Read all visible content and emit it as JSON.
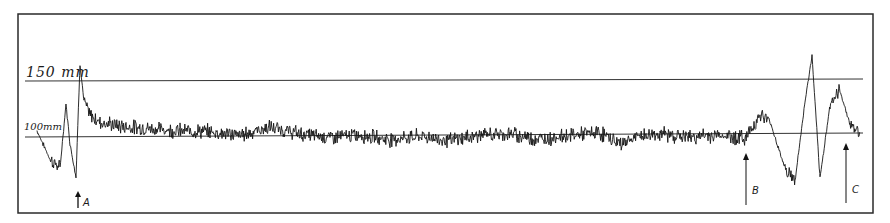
{
  "chart_data": {
    "type": "line",
    "title": "",
    "xlabel": "",
    "ylabel": "Pressure (mm)",
    "ylim": [
      60,
      175
    ],
    "grid": false,
    "reference_lines": [
      {
        "label": "150 mm",
        "value": 150
      },
      {
        "label": "100 mm",
        "value": 100
      }
    ],
    "annotations": [
      {
        "label": "A",
        "x_px": 78,
        "description": "arrow marking event A near start of trace"
      },
      {
        "label": "B",
        "x_px": 746,
        "description": "arrow marking event B, onset of rise"
      },
      {
        "label": "C",
        "x_px": 846,
        "description": "arrow marking event C near end of trace"
      }
    ],
    "series": [
      {
        "name": "pressure trace",
        "description": "Noisy continuous recording oscillating around ~100 mm for most of its length, with large excursions near A (rising above 150 mm) and between B and C (peaks above 150 mm and drops to ~55 mm).",
        "x_px": [
          37,
          50,
          60,
          66,
          70,
          76,
          80,
          84,
          90,
          100,
          120,
          150,
          180,
          210,
          240,
          270,
          300,
          330,
          360,
          390,
          420,
          450,
          480,
          510,
          540,
          570,
          600,
          620,
          640,
          660,
          690,
          720,
          745,
          760,
          770,
          785,
          795,
          805,
          812,
          820,
          830,
          840,
          850,
          860
        ],
        "values": [
          104,
          78,
          70,
          128,
          92,
          62,
          165,
          130,
          118,
          112,
          108,
          106,
          104,
          103,
          100,
          107,
          101,
          98,
          100,
          96,
          99,
          95,
          100,
          101,
          96,
          100,
          102,
          92,
          99,
          101,
          98,
          100,
          97,
          118,
          112,
          70,
          58,
          130,
          172,
          60,
          128,
          140,
          110,
          102
        ]
      }
    ]
  },
  "axis_labels": {
    "y150": "150 mm",
    "y100": "100mm"
  },
  "markers": {
    "a": "A",
    "b": "B",
    "c": "C"
  }
}
